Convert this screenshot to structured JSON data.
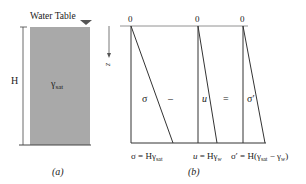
{
  "figure": {
    "panel_a": {
      "water_table_label": "Water Table",
      "height_label": "H",
      "unit_weight_symbol": "γ",
      "unit_weight_sub": "sat",
      "caption": "(a)"
    },
    "panel_b": {
      "zero_labels": [
        "0",
        "0",
        "0"
      ],
      "depth_axis_label": "z",
      "sigma_label": "σ",
      "minus_sign": "–",
      "u_label": "u",
      "equals_sign": "=",
      "sigma_eff_label": "σ′",
      "formula_sigma": {
        "lhs": "σ = Hγ",
        "sub": "sat"
      },
      "formula_u": {
        "lhs_var": "u",
        "rhs": " = Hγ",
        "sub": "w"
      },
      "formula_sigma_eff": {
        "lhs": "σ′ = H(γ",
        "sub1": "sat",
        "mid": " − γ",
        "sub2": "w",
        "tail": ")"
      },
      "caption": "(b)"
    },
    "colors": {
      "soil_fill": "#a9a9a9",
      "line": "#333333",
      "axis": "#777777",
      "text": "#222222"
    }
  }
}
